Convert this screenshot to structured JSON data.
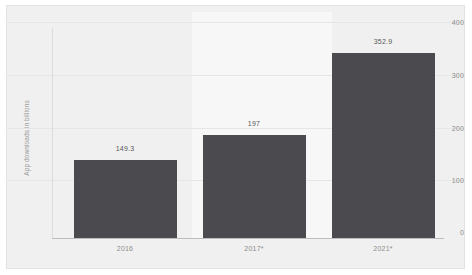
{
  "chart_data": {
    "type": "bar",
    "title": "",
    "subtitle": "",
    "xlabel": "",
    "ylabel": "App downloads in billions",
    "categories": [
      "2016",
      "2017*",
      "2021*"
    ],
    "values": [
      149.3,
      197,
      352.9
    ],
    "value_labels": [
      "149.3",
      "197",
      "352.9"
    ],
    "ylim": [
      0,
      400
    ],
    "yticks": [
      0,
      100,
      200,
      300,
      400
    ],
    "ytick_labels": [
      "0",
      "100",
      "200",
      "300",
      "400"
    ],
    "grid": true,
    "legend": false,
    "legend_position": "none",
    "series": [
      {
        "name": "App downloads",
        "values": [
          149.3,
          197,
          352.9
        ]
      }
    ],
    "colors": {
      "bar": "#4a4a4f",
      "panel_background": "#f0f0f0",
      "band_background": "#f7f7f7",
      "gridline": "#e6e6e6",
      "axis": "#bdbdbd",
      "tick_text": "#8c8c8c",
      "value_text": "#585858",
      "axis_label_text": "#9a9a9a",
      "page_background": "#ffffff"
    },
    "annotations": [
      {
        "text": "149.3",
        "category": "2016"
      },
      {
        "text": "197",
        "category": "2017*"
      },
      {
        "text": "352.9",
        "category": "2021*"
      }
    ]
  }
}
